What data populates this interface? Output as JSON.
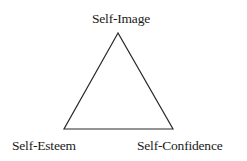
{
  "diagram": {
    "type": "triangle",
    "vertices": {
      "top": {
        "label": "Self-Image"
      },
      "bottom_left": {
        "label": "Self-Esteem"
      },
      "bottom_right": {
        "label": "Self-Confidence"
      }
    },
    "stroke_color": "#2a2a2a",
    "background_color": "#ffffff"
  }
}
